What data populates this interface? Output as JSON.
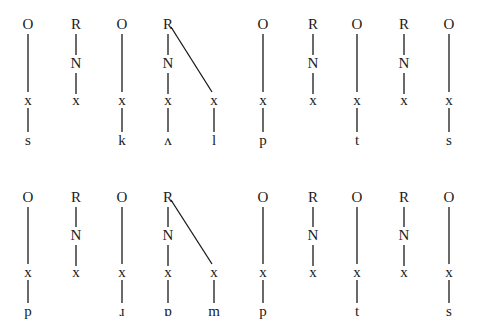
{
  "diagram": {
    "type": "syllable-structure-trees",
    "style": {
      "ink": "#1a1a1a",
      "background": "#ffffff"
    },
    "rows": [
      {
        "id": "row-1",
        "y": {
          "top": 24,
          "nucleus": 63,
          "skeleton": 100,
          "segment": 140
        },
        "constituents": [
          {
            "type": "O",
            "x": 28,
            "segments": [
              "s"
            ]
          },
          {
            "type": "R",
            "x": 76,
            "nucleus": "N",
            "segments": [
              null
            ]
          },
          {
            "type": "O",
            "x": 122,
            "segments": [
              "k"
            ]
          },
          {
            "type": "R",
            "x": 168,
            "nucleus": "N",
            "segments": [
              "ʌ"
            ],
            "coda": {
              "x": 214,
              "segment": "l"
            }
          },
          {
            "type": "O",
            "x": 263,
            "segments": [
              "p"
            ]
          },
          {
            "type": "R",
            "x": 313,
            "nucleus": "N",
            "segments": [
              null
            ]
          },
          {
            "type": "O",
            "x": 357,
            "segments": [
              "t"
            ]
          },
          {
            "type": "R",
            "x": 404,
            "nucleus": "N",
            "segments": [
              null
            ]
          },
          {
            "type": "O",
            "x": 449,
            "segments": [
              "s"
            ]
          }
        ]
      },
      {
        "id": "row-2",
        "y": {
          "top": 197,
          "nucleus": 235,
          "skeleton": 272,
          "segment": 311
        },
        "constituents": [
          {
            "type": "O",
            "x": 28,
            "segments": [
              "p"
            ]
          },
          {
            "type": "R",
            "x": 76,
            "nucleus": "N",
            "segments": [
              null
            ]
          },
          {
            "type": "O",
            "x": 122,
            "segments": [
              "ɹ"
            ]
          },
          {
            "type": "R",
            "x": 168,
            "nucleus": "N",
            "segments": [
              "ɒ"
            ],
            "coda": {
              "x": 214,
              "segment": "m"
            }
          },
          {
            "type": "O",
            "x": 263,
            "segments": [
              "p"
            ]
          },
          {
            "type": "R",
            "x": 313,
            "nucleus": "N",
            "segments": [
              null
            ]
          },
          {
            "type": "O",
            "x": 357,
            "segments": [
              "t"
            ]
          },
          {
            "type": "R",
            "x": 404,
            "nucleus": "N",
            "segments": [
              null
            ]
          },
          {
            "type": "O",
            "x": 449,
            "segments": [
              "s"
            ]
          }
        ]
      }
    ],
    "labels": {
      "onset": "O",
      "rime": "R",
      "nucleus": "N",
      "skeletal_slot": "x"
    }
  }
}
